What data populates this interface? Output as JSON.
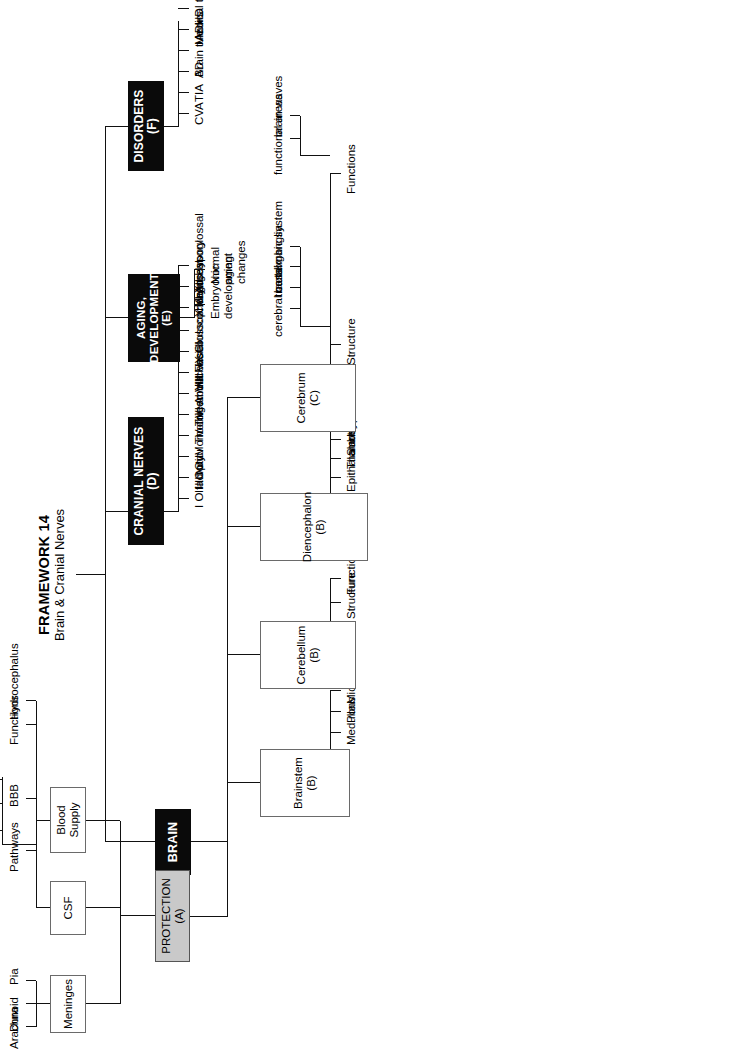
{
  "title": {
    "line1": "FRAMEWORK 14",
    "line2": "Brain & Cranial Nerves"
  },
  "root": {
    "label": "BRAIN"
  },
  "branches": {
    "protection": {
      "label": "PROTECTION (A)",
      "children": [
        {
          "label": "Meninges",
          "children": [
            "Dura",
            "Arachnoid",
            "Pia"
          ]
        },
        {
          "label": "CSF",
          "children": [
            "Pathways",
            "Functions",
            "Hydrocephalus"
          ],
          "pathways": [
            "choroid plexuses in ventricle",
            "subarachnoid space",
            "cranial venous sinuses"
          ]
        },
        {
          "label": "Blood Supply",
          "children": [
            "BBB"
          ]
        }
      ]
    },
    "brainstem": {
      "label": "Brainstem (B)",
      "children": [
        "Medulla",
        "Pons",
        "Midbrain"
      ]
    },
    "cerebellum": {
      "label": "Cerebellum (B)",
      "children": [
        "Structure",
        "Functions"
      ]
    },
    "diencephalon": {
      "label": "Diencephalon (B)",
      "children": [
        "Epithalamus",
        "Thalamus",
        "Subthalamus",
        "Hypothalamus"
      ]
    },
    "cerebrum": {
      "label": "Cerebrum (C)",
      "children": [
        "Structure",
        "Functions"
      ],
      "structure": [
        "cerebral cortex",
        "tracts",
        "basal ganglia",
        "limbic system"
      ],
      "functions": [
        "functional areas",
        "brain waves"
      ]
    },
    "cranial_nerves": {
      "label": "CRANIAL NERVES (D)",
      "children": [
        "I Olfactory",
        "II Optic",
        "III Oculomotor",
        "IV Trochlear",
        "V Trigeminal",
        "VI Abducens",
        "VII Facial",
        "VIII Vestibulocochlear",
        "IX Glossopharyngeal",
        "X Vagus",
        "XI Accessory",
        "XII Hypoglossal"
      ]
    },
    "aging": {
      "label_line1": "AGING,",
      "label_line2": "DEVELOPMENT (E)",
      "children": [
        "Embryonic development",
        "Normal aging changes"
      ]
    },
    "disorders": {
      "label": "DISORDERS (F)",
      "children": [
        "CVA",
        "TIA",
        "AD",
        "Brain tumors",
        "ADHD",
        "Medical terms"
      ]
    }
  },
  "colors": {
    "box_black": "#0a0a0a",
    "box_gray": "#c9c9c9",
    "line": "#111111",
    "background": "#ffffff"
  }
}
